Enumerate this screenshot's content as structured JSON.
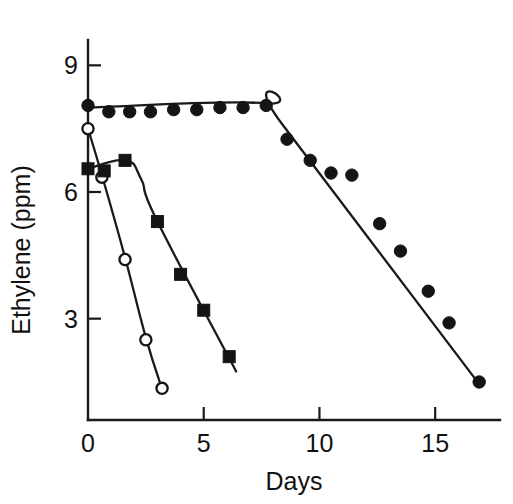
{
  "chart_data": {
    "type": "line",
    "title": "",
    "subtitle": "",
    "xlabel": "Days",
    "ylabel": "Ethylene (ppm)",
    "xlim": [
      0,
      17.8
    ],
    "ylim": [
      0.6,
      9.6
    ],
    "xticks": [
      0,
      5,
      10,
      15
    ],
    "xtick_labels": [
      "0",
      "5",
      "10",
      "15"
    ],
    "yticks": [
      3,
      6,
      9
    ],
    "ytick_labels": [
      "3",
      "6",
      "9"
    ],
    "grid": false,
    "legend": "none",
    "annotations": [],
    "series": [
      {
        "name": "filled-circles",
        "marker": "filled circle",
        "color": "#141414",
        "x": [
          0,
          0.9,
          1.8,
          2.7,
          3.7,
          4.7,
          5.7,
          6.7,
          7.7,
          8.6,
          9.6,
          10.5,
          11.4,
          12.6,
          13.5,
          14.7,
          15.6,
          16.9
        ],
        "y": [
          8.05,
          7.9,
          7.9,
          7.9,
          7.95,
          7.95,
          8.0,
          8.0,
          8.05,
          7.25,
          6.75,
          6.45,
          6.4,
          5.25,
          4.6,
          3.65,
          2.9,
          1.5
        ],
        "fit_line": [
          {
            "x": 0,
            "y": 8.0
          },
          {
            "x": 7.7,
            "y": 8.1
          },
          {
            "x": 8.4,
            "y": 7.6
          },
          {
            "x": 16.9,
            "y": 1.45
          }
        ]
      },
      {
        "name": "open-circles",
        "marker": "open circle",
        "color": "#ffffff",
        "x": [
          0,
          0.6,
          1.6,
          2.5,
          3.2
        ],
        "y": [
          7.5,
          6.35,
          4.4,
          2.5,
          1.35
        ],
        "fit_line": [
          {
            "x": 0,
            "y": 7.5
          },
          {
            "x": 0.6,
            "y": 6.4
          },
          {
            "x": 1.6,
            "y": 4.45
          },
          {
            "x": 2.5,
            "y": 2.55
          },
          {
            "x": 3.25,
            "y": 1.25
          }
        ]
      },
      {
        "name": "filled-squares",
        "marker": "filled square",
        "color": "#141414",
        "x": [
          0,
          0.7,
          1.6,
          3.0,
          4.0,
          5.0,
          6.1
        ],
        "y": [
          6.55,
          6.5,
          6.75,
          5.3,
          4.05,
          3.2,
          2.1
        ],
        "fit_line": [
          {
            "x": 0,
            "y": 6.55
          },
          {
            "x": 1.6,
            "y": 6.75
          },
          {
            "x": 2.3,
            "y": 6.3
          },
          {
            "x": 3.0,
            "y": 5.3
          },
          {
            "x": 6.4,
            "y": 1.75
          }
        ]
      }
    ]
  }
}
